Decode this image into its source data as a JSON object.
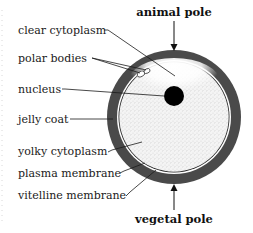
{
  "figure": {
    "poles": {
      "top": "animal pole",
      "bottom": "vegetal pole"
    },
    "labels": [
      {
        "id": "clear-cytoplasm",
        "text": "clear cytoplasm"
      },
      {
        "id": "polar-bodies",
        "text": "polar bodies"
      },
      {
        "id": "nucleus",
        "text": "nucleus"
      },
      {
        "id": "jelly-coat",
        "text": "jelly coat"
      },
      {
        "id": "yolky-cytoplasm",
        "text": "yolky cytoplasm"
      },
      {
        "id": "plasma-membrane",
        "text": "plasma membrane"
      },
      {
        "id": "vitelline-membrane",
        "text": "vitelline membrane"
      }
    ],
    "colors": {
      "jelly_coat": "#4a4a4a",
      "cytoplasm": "#f2f2f2",
      "nucleus": "#000000",
      "stipple": "#8a8a8a"
    }
  }
}
